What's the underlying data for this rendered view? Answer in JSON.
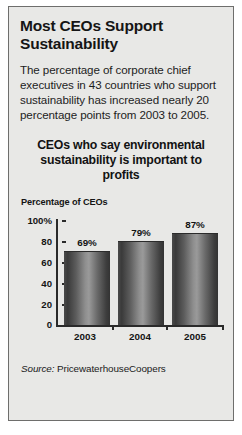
{
  "headline": "Most CEOs Support Sustainability",
  "deck": "The percentage of corporate chief executives in 43 countries who support sustainability has increased nearly 20 percentage points from 2003 to 2005.",
  "source": {
    "label": "Source:",
    "name": "PricewaterhouseCoopers"
  },
  "colors": {
    "panel_background": "#e8e8e6",
    "panel_border": "#6e6e6c",
    "text": "#151515",
    "axis": "#2a2a2a",
    "bar_dark": "#333333",
    "bar_light": "#9a9a9a"
  },
  "chart_data": {
    "type": "bar",
    "title": "CEOs who say environmental sustainability is important to profits",
    "xlabel": "",
    "ylabel": "Percentage of CEOs",
    "categories": [
      "2003",
      "2004",
      "2005"
    ],
    "values": [
      69,
      79,
      87
    ],
    "value_labels": [
      "69%",
      "79%",
      "87%"
    ],
    "ylim": [
      0,
      100
    ],
    "yticks": [
      100,
      80,
      60,
      40,
      20,
      0
    ],
    "ytick_labels": [
      "100%",
      "80",
      "60",
      "40",
      "20",
      "0"
    ],
    "grid": false,
    "legend": "none"
  }
}
